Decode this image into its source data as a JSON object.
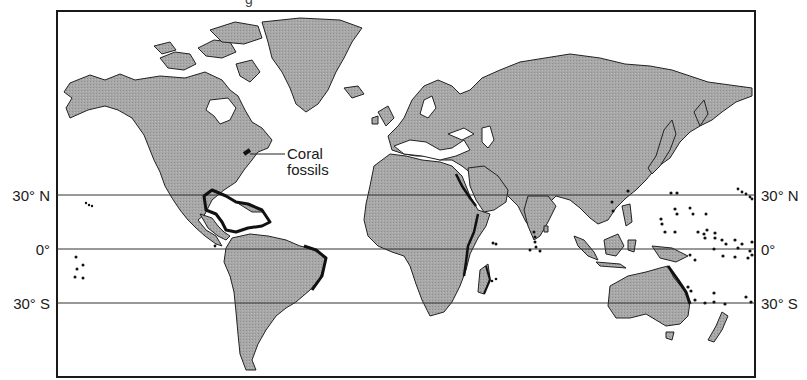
{
  "figure": {
    "title_fragment": "g",
    "annotation": {
      "line1": "Coral",
      "line2": "fossils",
      "pointer_target": "eastern North America coast"
    },
    "latitude_lines": [
      {
        "label": "30° N",
        "y": 195
      },
      {
        "label": "0°",
        "y": 249
      },
      {
        "label": "30° S",
        "y": 303
      }
    ],
    "colors": {
      "land": "#a6a6a6",
      "coastline": "#1a1a1a",
      "reef_highlight": "#111111",
      "ocean": "#ffffff",
      "frame": "#1a1a1a"
    },
    "reef_regions": [
      "Gulf of Mexico & Caribbean",
      "Eastern Brazil coast",
      "Red Sea",
      "East African coast & Madagascar",
      "Western India & Maldives",
      "Southeast Asia & Indonesia",
      "Great Barrier Reef (NE Australia)",
      "Pacific islands"
    ]
  }
}
